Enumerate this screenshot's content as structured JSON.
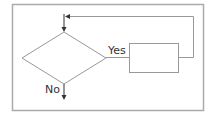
{
  "diagram": {
    "type": "flowchart",
    "colors": {
      "frame": "#aaaaaa",
      "stroke": "#999999",
      "arrow": "#333333",
      "text": "#333333"
    },
    "nodes": [
      {
        "id": "decision",
        "shape": "diamond",
        "label": ""
      },
      {
        "id": "process",
        "shape": "rectangle",
        "label": ""
      }
    ],
    "edges": [
      {
        "from": "decision",
        "to": "process",
        "label": "Yes"
      },
      {
        "from": "process",
        "to": "decision",
        "label": "",
        "kind": "loop-back"
      },
      {
        "from": "decision",
        "to": "exit",
        "label": "No"
      }
    ],
    "labels": {
      "yes": "Yes",
      "no": "No"
    }
  }
}
